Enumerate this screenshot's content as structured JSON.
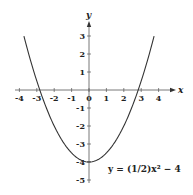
{
  "chart_data": {
    "type": "line",
    "title": "",
    "xlabel": "x",
    "ylabel": "y",
    "xlim": [
      -4,
      4
    ],
    "ylim": [
      -5,
      3
    ],
    "x_ticks": [
      -4,
      -3,
      -2,
      -1,
      0,
      1,
      2,
      3,
      4
    ],
    "y_ticks": [
      3,
      2,
      1,
      -1,
      -2,
      -3,
      -4,
      -5
    ],
    "grid": false,
    "series": [
      {
        "name": "y = (1/2)x² − 4",
        "function": "0.5*x^2 - 4",
        "x": [
          -3.74,
          -3.5,
          -3,
          -2.83,
          -2.5,
          -2,
          -1.5,
          -1,
          -0.5,
          0,
          0.5,
          1,
          1.5,
          2,
          2.5,
          2.83,
          3,
          3.5,
          3.74
        ],
        "values": [
          3.0,
          2.125,
          0.5,
          0.0,
          -0.875,
          -2.0,
          -2.875,
          -3.5,
          -3.875,
          -4.0,
          -3.875,
          -3.5,
          -2.875,
          -2.0,
          -0.875,
          0.0,
          0.5,
          2.125,
          3.0
        ]
      }
    ],
    "annotations": [
      {
        "text": "y = (1/2)x² − 4",
        "position": "lower-right"
      }
    ]
  },
  "labels": {
    "x_axis": "x",
    "y_axis": "y",
    "equation": "y = (1/2)x² − 4"
  }
}
